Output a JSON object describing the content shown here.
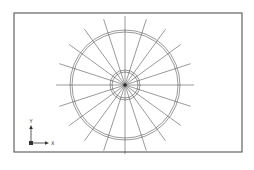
{
  "diagram": {
    "type": "cad-wheel-spokes",
    "frame": {
      "x": 14,
      "y": 13,
      "w": 228,
      "h": 139,
      "stroke": "#444444"
    },
    "center": {
      "x": 125,
      "y": 85
    },
    "inner_circles": [
      13,
      15
    ],
    "outer_circles": [
      53,
      55
    ],
    "spoke_count": 20,
    "spoke_length": 69,
    "line_color": "#555555",
    "axis_indicator": {
      "origin": {
        "x": 31,
        "y": 143
      },
      "x_label": "X",
      "y_label": "Y"
    }
  }
}
